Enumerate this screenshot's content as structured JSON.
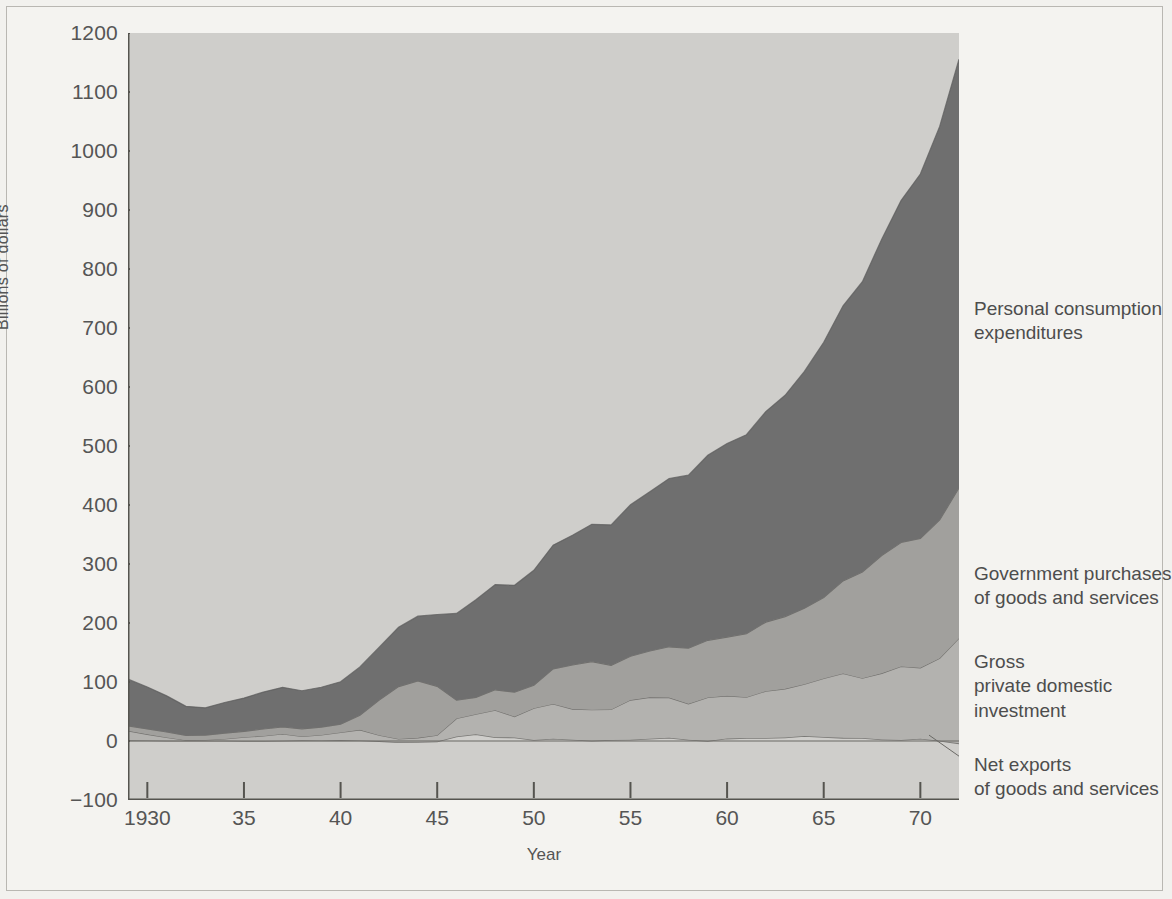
{
  "chart_data": {
    "type": "area",
    "stacked": true,
    "title": "",
    "xlabel": "Year",
    "ylabel": "Billions of dollars",
    "xlim": [
      1929,
      1972
    ],
    "ylim": [
      -100,
      1200
    ],
    "ytick_values": [
      -100,
      0,
      100,
      200,
      300,
      400,
      500,
      600,
      700,
      800,
      900,
      1000,
      1100,
      1200
    ],
    "ytick_labels": [
      "−100",
      "0",
      "100",
      "200",
      "300",
      "400",
      "500",
      "600",
      "700",
      "800",
      "900",
      "1000",
      "1100",
      "1200"
    ],
    "xtick_values": [
      1930,
      1935,
      1940,
      1945,
      1950,
      1955,
      1960,
      1965,
      1970
    ],
    "xtick_labels": [
      "1930",
      "35",
      "40",
      "45",
      "50",
      "55",
      "60",
      "65",
      "70"
    ],
    "grid": false,
    "legend_position": "right-inline-annotations",
    "x": [
      1929,
      1930,
      1931,
      1932,
      1933,
      1934,
      1935,
      1936,
      1937,
      1938,
      1939,
      1940,
      1941,
      1942,
      1943,
      1944,
      1945,
      1946,
      1947,
      1948,
      1949,
      1950,
      1951,
      1952,
      1953,
      1954,
      1955,
      1956,
      1957,
      1958,
      1959,
      1960,
      1961,
      1962,
      1963,
      1964,
      1965,
      1966,
      1967,
      1968,
      1969,
      1970,
      1971,
      1972
    ],
    "series": [
      {
        "name": "Net exports of goods and services",
        "color": "#cfcecb",
        "values": [
          1.1,
          1.0,
          0.5,
          0.4,
          0.4,
          0.6,
          0.1,
          0.1,
          0.3,
          1.1,
          0.9,
          1.5,
          1.0,
          -0.2,
          -2.2,
          -1.8,
          -0.8,
          7.5,
          11.5,
          6.4,
          6.1,
          1.8,
          3.7,
          2.2,
          0.4,
          1.8,
          2.0,
          4.0,
          5.7,
          2.2,
          0.1,
          4.1,
          5.2,
          5.0,
          5.9,
          8.5,
          6.9,
          5.3,
          5.2,
          2.5,
          1.9,
          3.9,
          0.6,
          -4.0
        ]
      },
      {
        "name": "Gross private domestic investment",
        "color": "#b3b2af",
        "values": [
          16.2,
          10.3,
          5.5,
          0.9,
          1.4,
          2.9,
          6.3,
          8.4,
          11.7,
          6.7,
          9.3,
          13.1,
          17.9,
          9.9,
          5.8,
          7.1,
          10.6,
          30.7,
          34.0,
          45.9,
          35.3,
          53.8,
          59.2,
          51.9,
          52.6,
          51.7,
          67.4,
          70.0,
          67.9,
          60.9,
          73.6,
          72.4,
          69.0,
          79.4,
          82.5,
          87.8,
          99.2,
          109.3,
          101.2,
          112.2,
          124.5,
          120.1,
          139.7,
          178.2
        ]
      },
      {
        "name": "Government purchases of goods and services",
        "color": "#a1a09d",
        "values": [
          8.5,
          9.2,
          9.2,
          8.1,
          8.0,
          9.8,
          10.0,
          11.8,
          11.7,
          12.8,
          13.3,
          14.0,
          24.8,
          59.7,
          88.6,
          96.5,
          82.9,
          30.9,
          28.4,
          34.5,
          41.3,
          38.8,
          59.3,
          74.7,
          81.6,
          74.8,
          74.2,
          78.6,
          86.1,
          94.2,
          97.0,
          99.6,
          107.6,
          117.1,
          122.5,
          128.9,
          137.0,
          156.8,
          180.1,
          199.6,
          210.0,
          219.4,
          234.3,
          255.0
        ]
      },
      {
        "name": "Personal consumption expenditures",
        "color": "#6f6f6f",
        "values": [
          79.0,
          71.0,
          61.3,
          49.3,
          46.4,
          51.9,
          56.3,
          62.6,
          67.3,
          64.6,
          67.6,
          71.9,
          81.9,
          89.7,
          100.5,
          109.8,
          121.7,
          147.1,
          165.4,
          178.3,
          181.2,
          195.0,
          209.8,
          219.8,
          232.6,
          238.0,
          256.9,
          269.9,
          285.2,
          293.2,
          313.5,
          328.2,
          337.3,
          356.8,
          375.0,
          401.2,
          432.8,
          466.3,
          492.1,
          536.2,
          579.5,
          617.6,
          667.1,
          726.5
        ]
      }
    ],
    "totals_note": "Stacked: net exports + gross private domestic investment + government purchases + personal consumption expenditures = GNP",
    "final_total": 1155.2
  },
  "axes": {
    "y_title": "Billions of dollars",
    "x_title": "Year"
  },
  "annotations": {
    "pce": {
      "line1": "Personal consumption",
      "line2": "expenditures"
    },
    "gov": {
      "line1": "Government purchases",
      "line2": "of goods and services"
    },
    "inv": {
      "line1": "Gross",
      "line2": "private domestic",
      "line3": "investment"
    },
    "net": {
      "line1": "Net exports",
      "line2": "of goods and services"
    }
  },
  "colors": {
    "page_background": "#f2f1ee",
    "frame_border": "#b9b7b2",
    "plot_background": "#cfcecb",
    "axis_line": "#55544f",
    "text": "#4d4d4d",
    "series_net_exports": "#cfcecb",
    "series_investment": "#b3b2af",
    "series_government": "#a1a09d",
    "series_consumption": "#6f6f6f"
  }
}
